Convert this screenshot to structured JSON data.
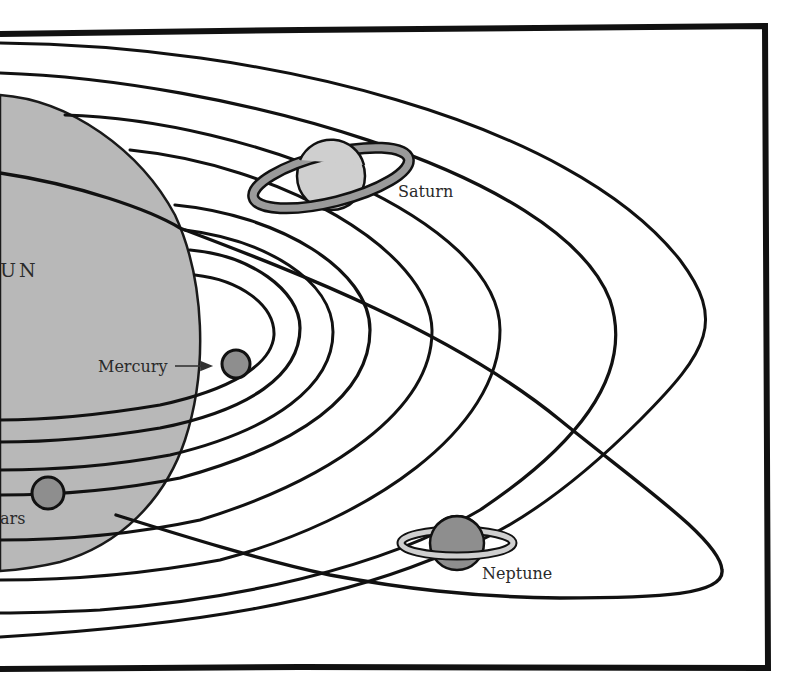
{
  "diagram": {
    "type": "solar-system-orbits",
    "colors": {
      "background": "#ffffff",
      "frame": "#111111",
      "orbit_line": "#111111",
      "sun_fill": "#b8b8b8",
      "planet_fill_dark": "#8e8e8e",
      "planet_fill_light": "#cfcfcf",
      "ring_fill": "#9a9a9a",
      "label_text": "#2a2a2a"
    },
    "sun": {
      "label": "UN"
    },
    "planets": [
      {
        "name": "Mercury",
        "label": "Mercury",
        "has_arrow": true
      },
      {
        "name": "Mars",
        "label": "ars"
      },
      {
        "name": "Saturn",
        "label": "Saturn",
        "has_rings": true
      },
      {
        "name": "Neptune",
        "label": "Neptune",
        "has_rings": true
      }
    ],
    "orbit_count": 9
  }
}
